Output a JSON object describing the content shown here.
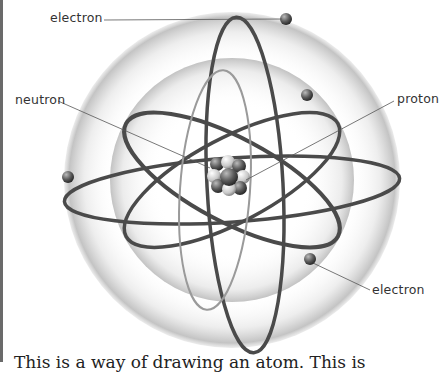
{
  "diagram": {
    "labels": {
      "electron_top": "electron",
      "neutron": "neutron",
      "proton": "proton",
      "electron_bottom": "electron"
    }
  },
  "caption": {
    "text": "This is a way of drawing an atom. This is"
  },
  "colors": {
    "orbit": "#4a4a4a",
    "shell_outer": "#d8d8d8",
    "shell_inner": "#c8c8c8",
    "electron": "#5a5a5a",
    "border": "#6a6a6a"
  }
}
